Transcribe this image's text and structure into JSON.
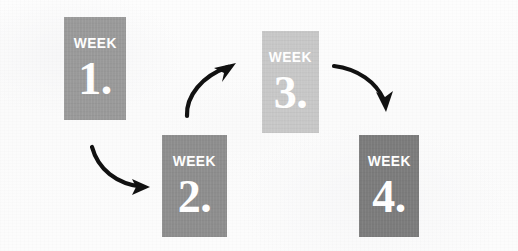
{
  "diagram": {
    "background_color": "#fcfcfc",
    "cards": [
      {
        "id": "week-1",
        "week_label": "WEEK",
        "number_label": "1.",
        "color": "#9a9a9a",
        "x": 64,
        "y": 17,
        "w": 62,
        "h": 103
      },
      {
        "id": "week-2",
        "week_label": "WEEK",
        "number_label": "2.",
        "color": "#8e8e8e",
        "x": 162,
        "y": 135,
        "w": 65,
        "h": 102
      },
      {
        "id": "week-3",
        "week_label": "WEEK",
        "number_label": "3.",
        "color": "#c8c8c8",
        "x": 262,
        "y": 31,
        "w": 57,
        "h": 102
      },
      {
        "id": "week-4",
        "week_label": "WEEK",
        "number_label": "4.",
        "color": "#7c7c7c",
        "x": 359,
        "y": 135,
        "w": 60,
        "h": 102
      }
    ],
    "arrows": [
      {
        "id": "arrow-1-to-2",
        "direction": "down-right",
        "color": "#111111",
        "from": "week-1",
        "to": "week-2"
      },
      {
        "id": "arrow-2-to-3",
        "direction": "up-right",
        "color": "#111111",
        "from": "week-2",
        "to": "week-3"
      },
      {
        "id": "arrow-3-to-4",
        "direction": "down-right",
        "color": "#111111",
        "from": "week-3",
        "to": "week-4"
      }
    ]
  }
}
